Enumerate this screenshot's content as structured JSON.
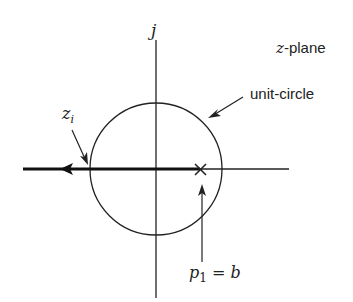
{
  "diagram": {
    "type": "z-plane pole locus",
    "labels": {
      "imag_axis": "j",
      "plane": "-plane",
      "plane_var": "z",
      "unit_circle": "unit-circle",
      "zi_base": "z",
      "zi_sub": "i",
      "pole_base": "p",
      "pole_sub": "1",
      "pole_rest": " = b"
    },
    "geometry": {
      "origin": [
        156,
        169
      ],
      "unit_circle_radius": 66,
      "pole_x": 200,
      "locus_direction": "leftward along real axis"
    },
    "colors": {
      "stroke": "#222222",
      "background": "#ffffff"
    }
  }
}
